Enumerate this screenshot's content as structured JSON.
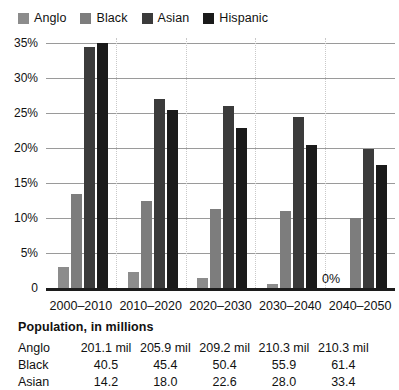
{
  "chart_data": {
    "type": "bar",
    "title": "",
    "xlabel": "",
    "ylabel": "",
    "ylim": [
      0,
      35
    ],
    "grid": true,
    "legend_position": "top-left",
    "categories": [
      "2000–2010",
      "2010–2020",
      "2020–2030",
      "2030–2040",
      "2040–2050"
    ],
    "ytick_labels": [
      "0",
      "5%",
      "10%",
      "15%",
      "20%",
      "25%",
      "30%",
      "35%"
    ],
    "ytick_values": [
      0,
      5,
      10,
      15,
      20,
      25,
      30,
      35
    ],
    "series": [
      {
        "name": "Anglo",
        "color": "#8c8c8c",
        "values": [
          3.0,
          2.3,
          1.5,
          0.6,
          0.0
        ]
      },
      {
        "name": "Black",
        "color": "#7d7d7d",
        "values": [
          13.5,
          12.4,
          11.3,
          11.0,
          10.0
        ]
      },
      {
        "name": "Asian",
        "color": "#3b3b3b",
        "values": [
          34.5,
          27.0,
          26.0,
          24.4,
          19.8
        ]
      },
      {
        "name": "Hispanic",
        "color": "#1a1a1a",
        "values": [
          35.0,
          25.4,
          22.8,
          20.4,
          17.6
        ]
      }
    ],
    "annotations": [
      {
        "text": "0%",
        "category": "2040–2050",
        "series": "Anglo",
        "value": 0
      }
    ]
  },
  "legend": {
    "items": [
      {
        "label": "Anglo",
        "color": "#8c8c8c"
      },
      {
        "label": "Black",
        "color": "#7d7d7d"
      },
      {
        "label": "Asian",
        "color": "#3b3b3b"
      },
      {
        "label": "Hispanic",
        "color": "#1a1a1a"
      }
    ]
  },
  "table": {
    "title": "Population, in millions",
    "rows": [
      {
        "label": "Anglo",
        "values": [
          "201.1 mil",
          "205.9 mil",
          "209.2 mil",
          "210.3 mil",
          "210.3 mil"
        ]
      },
      {
        "label": "Black",
        "values": [
          "40.5",
          "45.4",
          "50.4",
          "55.9",
          "61.4"
        ]
      },
      {
        "label": "Asian",
        "values": [
          "14.2",
          "18.0",
          "22.6",
          "28.0",
          "33.4"
        ]
      }
    ]
  }
}
